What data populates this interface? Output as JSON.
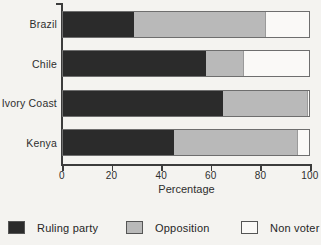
{
  "chart_data": {
    "type": "bar",
    "orientation": "horizontal",
    "stacked": true,
    "title": "",
    "categories": [
      "Brazil",
      "Chile",
      "Ivory Coast",
      "Kenya"
    ],
    "series": [
      {
        "name": "Ruling party",
        "color": "#2b2b2b",
        "values": [
          29,
          58,
          65,
          45
        ]
      },
      {
        "name": "Opposition",
        "color": "#b9b9b9",
        "values": [
          53,
          15,
          34,
          50
        ]
      },
      {
        "name": "Non voter",
        "color": "#faf9f7",
        "values": [
          18,
          27,
          1,
          5
        ]
      }
    ],
    "xlabel": "Percentage",
    "ylabel": "",
    "xlim": [
      0,
      100
    ],
    "xticks": [
      0,
      20,
      40,
      60,
      80,
      100
    ],
    "grid": false,
    "legend_position": "bottom"
  },
  "colors": {
    "background": "#f4f3f0",
    "axis": "#3c3c3c",
    "bar_border": "#6e6e6e",
    "text": "#2e2e2e"
  }
}
